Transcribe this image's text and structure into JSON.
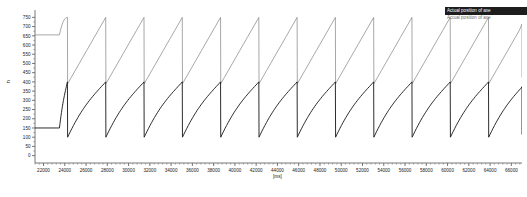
{
  "chart_data": {
    "type": "line",
    "title": "",
    "xlabel": "[ms]",
    "ylabel": "n",
    "xlim": [
      21200,
      67000
    ],
    "ylim": [
      -40,
      790
    ],
    "grid": false,
    "legend_position": "top-right",
    "x_ticks": [
      22000,
      24000,
      26000,
      28000,
      30000,
      32000,
      34000,
      36000,
      38000,
      40000,
      42000,
      44000,
      46000,
      48000,
      50000,
      52000,
      54000,
      56000,
      58000,
      60000,
      62000,
      64000,
      66000
    ],
    "x_tick_labels": [
      "22000",
      "24000",
      "26000",
      "28000",
      "30000",
      "32000",
      "34000",
      "36000",
      "38000",
      "40000",
      "42000",
      "44000",
      "46000",
      "48000",
      "50000",
      "52000",
      "54000",
      "56000",
      "58000",
      "60000",
      "62000",
      "64000",
      "66000"
    ],
    "x_unit": "[ms]",
    "y_ticks": [
      0,
      50,
      100,
      150,
      200,
      250,
      300,
      350,
      400,
      450,
      500,
      550,
      600,
      650,
      700,
      750
    ],
    "y_tick_labels": [
      "0",
      "50",
      "100",
      "150",
      "200",
      "250",
      "300",
      "350",
      "400",
      "450",
      "500",
      "550",
      "600",
      "650",
      "700",
      "750"
    ],
    "period_ms": 3600,
    "series": [
      {
        "name": "Actual position of axe",
        "color": "#8a8a8a",
        "style": "sawtooth-linear",
        "min": 390,
        "max": 750,
        "initial_value": 655,
        "flat_until_ms": 23500,
        "first_peak_ms": 24250,
        "cycles": 12
      },
      {
        "name": "Actual position of axe",
        "color": "#222222",
        "style": "sawtooth-scurve",
        "min": 100,
        "max": 400,
        "initial_value": 150,
        "flat_until_ms": 23500,
        "first_peak_ms": 24250,
        "cycles": 12
      }
    ]
  },
  "legend": {
    "entries": [
      {
        "label": "Actual position of axe",
        "state": "selected"
      },
      {
        "label": "Actual position of axe",
        "state": "unselected"
      }
    ]
  }
}
